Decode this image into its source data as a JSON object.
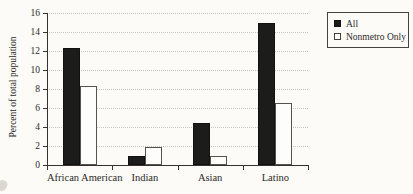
{
  "page": {
    "background": "#fcfbf8"
  },
  "chart_data": {
    "type": "bar",
    "categories": [
      "African American",
      "Indian",
      "Asian",
      "Latino"
    ],
    "series": [
      {
        "name": "All",
        "values": [
          12.3,
          1.0,
          4.4,
          15.0
        ],
        "fill": "#1c1c1a"
      },
      {
        "name": "Nonmetro Only",
        "values": [
          8.3,
          1.9,
          0.9,
          6.5
        ],
        "fill": "#fdfdfb"
      }
    ],
    "title": "",
    "xlabel": "",
    "ylabel": "Percent of total population",
    "ylim": [
      0,
      16
    ],
    "ytick_step": 2,
    "yticks": [
      0,
      2,
      4,
      6,
      8,
      10,
      12,
      14,
      16
    ],
    "grid": "horizontal-dotted",
    "legend_position": "top-right",
    "legend_entries": [
      "All",
      "Nonmetro Only"
    ]
  }
}
